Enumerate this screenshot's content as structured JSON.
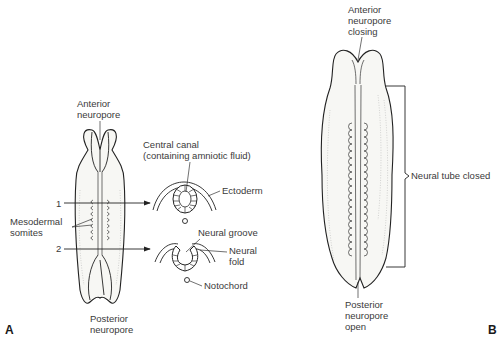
{
  "figure": {
    "panels": [
      {
        "id": "A",
        "label": "A",
        "labels": {
          "anterior_neuropore": [
            "Anterior",
            "neuropore"
          ],
          "posterior_neuropore": [
            "Posterior",
            "neuropore"
          ],
          "mesodermal_somites": [
            "Mesodermal",
            "somites"
          ],
          "section_1": "1",
          "section_2": "2",
          "central_canal": [
            "Central canal",
            "(containing amniotic fluid)"
          ],
          "ectoderm": "Ectoderm",
          "neural_groove": "Neural groove",
          "neural_fold": [
            "Neural",
            "fold"
          ],
          "notochord": "Notochord"
        }
      },
      {
        "id": "B",
        "label": "B",
        "labels": {
          "anterior_neuropore": [
            "Anterior",
            "neuropore",
            "closing"
          ],
          "neural_tube_closed": "Neural tube closed",
          "posterior_neuropore": [
            "Posterior",
            "neuropore",
            "open"
          ]
        }
      }
    ],
    "colors": {
      "line": "#222222",
      "text": "#3a3a3a",
      "fill": "#f7f7f4"
    }
  }
}
